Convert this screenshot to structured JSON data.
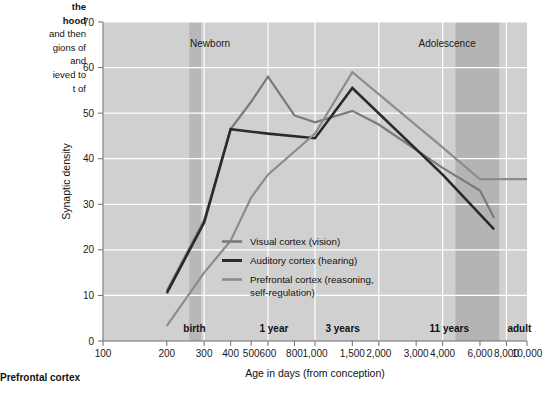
{
  "caption": {
    "lines": [
      {
        "text": "the",
        "bold": true
      },
      {
        "text": "hood",
        "bold": true
      },
      {
        "text": "and then",
        "bold": false
      },
      {
        "text": "gions of",
        "bold": false
      },
      {
        "text": "and",
        "bold": false
      },
      {
        "text": "ieved to",
        "bold": false
      },
      {
        "text": "t of",
        "bold": false
      }
    ]
  },
  "bottom_label": "Prefrontal cortex",
  "chart_data": {
    "type": "line",
    "title": "",
    "xlabel": "Age in days (from conception)",
    "ylabel": "Synaptic density",
    "xscale": "log",
    "xlim": [
      100,
      10000
    ],
    "ylim": [
      0,
      70
    ],
    "yticks": [
      0,
      10,
      20,
      30,
      40,
      50,
      60,
      70
    ],
    "xticks": [
      100,
      200,
      300,
      400,
      500,
      600,
      800,
      1000,
      1500,
      2000,
      3000,
      4000,
      6000,
      8000,
      10000
    ],
    "xtick_labels": [
      "100",
      "200",
      "300",
      "400",
      "500",
      "600",
      "800",
      "1,000",
      "1,500",
      "2,000",
      "3,000",
      "4,000",
      "6,000",
      "8,000",
      "10,000"
    ],
    "grid": true,
    "legend_position": "inside-center",
    "series": [
      {
        "name": "Visual cortex (vision)",
        "color": "#7a7a7a",
        "points": [
          {
            "x": 200,
            "y": 11.0
          },
          {
            "x": 300,
            "y": 26.5
          },
          {
            "x": 400,
            "y": 46.5
          },
          {
            "x": 500,
            "y": 52.5
          },
          {
            "x": 600,
            "y": 58.0
          },
          {
            "x": 800,
            "y": 49.5
          },
          {
            "x": 1000,
            "y": 48.0
          },
          {
            "x": 1500,
            "y": 50.5
          },
          {
            "x": 2000,
            "y": 47.5
          },
          {
            "x": 4000,
            "y": 38.0
          },
          {
            "x": 6000,
            "y": 33.0
          },
          {
            "x": 7000,
            "y": 27.0
          }
        ]
      },
      {
        "name": "Auditory cortex (hearing)",
        "color": "#2b2b2b",
        "points": [
          {
            "x": 200,
            "y": 10.5
          },
          {
            "x": 300,
            "y": 26.0
          },
          {
            "x": 400,
            "y": 46.5
          },
          {
            "x": 600,
            "y": 45.5
          },
          {
            "x": 1000,
            "y": 44.5
          },
          {
            "x": 1500,
            "y": 55.5
          },
          {
            "x": 4000,
            "y": 36.5
          },
          {
            "x": 7000,
            "y": 24.5
          }
        ]
      },
      {
        "name": "Prefrontal cortex (reasoning, self-regulation)",
        "color": "#8c8c8c",
        "points": [
          {
            "x": 200,
            "y": 3.3
          },
          {
            "x": 300,
            "y": 15.0
          },
          {
            "x": 400,
            "y": 22.0
          },
          {
            "x": 500,
            "y": 31.5
          },
          {
            "x": 600,
            "y": 36.5
          },
          {
            "x": 1000,
            "y": 45.5
          },
          {
            "x": 1500,
            "y": 59.0
          },
          {
            "x": 4000,
            "y": 42.5
          },
          {
            "x": 6000,
            "y": 35.5
          },
          {
            "x": 10000,
            "y": 35.5
          }
        ]
      }
    ],
    "annotations": [
      {
        "name": "newborn",
        "text": "Newborn",
        "x": 320,
        "y": 64.5
      },
      {
        "name": "adolescence",
        "text": "Adolescence",
        "x": 4200,
        "y": 64.5
      }
    ],
    "milestones": [
      {
        "name": "birth",
        "text": "birth",
        "x": 270
      },
      {
        "name": "one-year",
        "text": "1 year",
        "x": 640
      },
      {
        "name": "three-years",
        "text": "3 years",
        "x": 1350
      },
      {
        "name": "eleven-years",
        "text": "11 years",
        "x": 4300
      },
      {
        "name": "adult",
        "text": "adult",
        "x": 9200
      }
    ],
    "bands": [
      {
        "name": "birth-band",
        "x0": 255,
        "x1": 290,
        "color": "#b8b8b8"
      },
      {
        "name": "adolescence-band",
        "x0": 4600,
        "x1": 7400,
        "color": "#b4b4b4"
      }
    ],
    "plot_background": "#d0d0d0"
  }
}
